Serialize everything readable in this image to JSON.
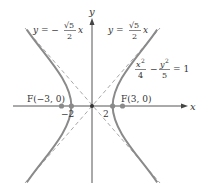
{
  "figure": {
    "type": "hyperbola",
    "equation": {
      "lhs_num1": "x",
      "lhs_exp1": "2",
      "lhs_den1": "4",
      "minus": "−",
      "lhs_num2": "y",
      "lhs_exp2": "2",
      "lhs_den2": "5",
      "rhs": "= 1"
    },
    "asymptote_left": {
      "lhs": "y = −",
      "num": "√5",
      "den": "2",
      "var": "x"
    },
    "asymptote_right": {
      "lhs": "y =",
      "num": "√5",
      "den": "2",
      "var": "x"
    },
    "axes": {
      "x_label": "x",
      "y_label": "y"
    },
    "vertices": [
      {
        "label": "−2",
        "x": -2,
        "y": 0
      },
      {
        "label": "2",
        "x": 2,
        "y": 0
      }
    ],
    "foci": [
      {
        "label": "F(−3, 0)",
        "x": -3,
        "y": 0
      },
      {
        "label": "F(3, 0)",
        "x": 3,
        "y": 0
      }
    ],
    "origin": {
      "x": 0,
      "y": 0
    },
    "colors": {
      "curve": "#8a8a8a",
      "asymptote": "#a8a8a8",
      "axis": "#555555",
      "point": "#8a8a8a",
      "text": "#333333"
    }
  }
}
